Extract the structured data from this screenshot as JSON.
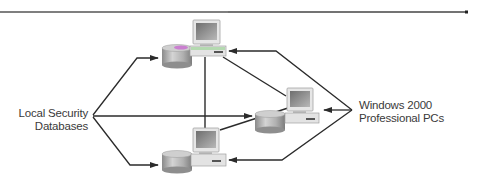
{
  "diagram": {
    "title": "",
    "labels": {
      "local_security_databases": [
        "Local Security",
        "Databases"
      ],
      "windows_pcs": [
        "Windows 2000",
        "Professional PCs"
      ]
    },
    "nodes": [
      {
        "id": "pc-top",
        "type": "workstation-with-database",
        "label": ""
      },
      {
        "id": "pc-middle",
        "type": "workstation-with-database",
        "label": ""
      },
      {
        "id": "pc-bottom",
        "type": "workstation-with-database",
        "label": ""
      }
    ],
    "edges": [
      {
        "from": "pc-top",
        "to": "pc-middle",
        "type": "network-link"
      },
      {
        "from": "pc-top",
        "to": "pc-bottom",
        "type": "network-link"
      },
      {
        "from": "pc-middle",
        "to": "pc-bottom",
        "type": "network-link"
      },
      {
        "from": "local_security_databases",
        "to": "pc-top.database",
        "type": "callout-arrow"
      },
      {
        "from": "local_security_databases",
        "to": "pc-middle.database",
        "type": "callout-arrow"
      },
      {
        "from": "local_security_databases",
        "to": "pc-bottom.database",
        "type": "callout-arrow"
      },
      {
        "from": "windows_pcs",
        "to": "pc-top",
        "type": "callout-arrow"
      },
      {
        "from": "windows_pcs",
        "to": "pc-middle",
        "type": "callout-arrow"
      },
      {
        "from": "windows_pcs",
        "to": "pc-bottom",
        "type": "callout-arrow"
      }
    ],
    "colors": {
      "line": "#2b2b2b",
      "rule": "#555555",
      "monitor_body": "#d9d9d9",
      "screen": "#8f8f8f",
      "db_body": "#b5b5b5",
      "accent_magenta": "#c86ad0",
      "accent_green": "#9fd49a"
    }
  }
}
